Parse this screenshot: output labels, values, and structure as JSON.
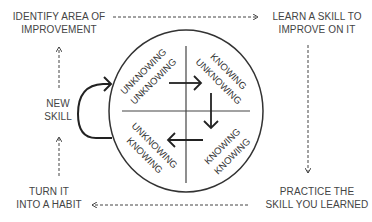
{
  "steps": {
    "identify": {
      "line1": "IDENTIFY AREA OF",
      "line2": "IMPROVEMENT"
    },
    "learn": {
      "line1": "LEARN A SKILL TO",
      "line2": "IMPROVE ON IT"
    },
    "practice": {
      "line1": "PRACTICE THE",
      "line2": "SKILL YOU LEARNED"
    },
    "habit": {
      "line1": "TURN IT",
      "line2": "INTO A HABIT"
    },
    "new_skill": {
      "line1": "NEW",
      "line2": "SKILL"
    }
  },
  "quadrants": {
    "top_left": {
      "line1": "UNKNOWING",
      "line2": "UNKNOWING"
    },
    "top_right": {
      "line1": "KNOWING",
      "line2": "UNKNOWING"
    },
    "bottom_right": {
      "line1": "KNOWING",
      "line2": "KNOWING"
    },
    "bottom_left": {
      "line1": "UNKNOWING",
      "line2": "KNOWING"
    }
  },
  "colors": {
    "text": "#444444",
    "line": "#333333",
    "background": "#ffffff"
  }
}
